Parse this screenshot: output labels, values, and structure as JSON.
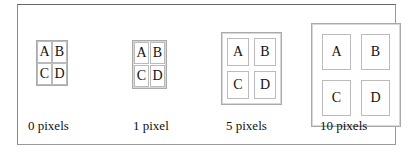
{
  "examples": [
    {
      "caption": "0 pixels",
      "cellspacing": 0,
      "cells": [
        "A",
        "B",
        "C",
        "D"
      ]
    },
    {
      "caption": "1 pixel",
      "cellspacing": 1,
      "cells": [
        "A",
        "B",
        "C",
        "D"
      ]
    },
    {
      "caption": "5 pixels",
      "cellspacing": 5,
      "cells": [
        "A",
        "B",
        "C",
        "D"
      ]
    },
    {
      "caption": "10 pixels",
      "cellspacing": 10,
      "cells": [
        "A",
        "B",
        "C",
        "D"
      ]
    }
  ],
  "colors": {
    "frame_border": "#777777",
    "cell_border": "#bbbbbb",
    "table_border": "#aaaaaa",
    "background": "#ffffff"
  }
}
